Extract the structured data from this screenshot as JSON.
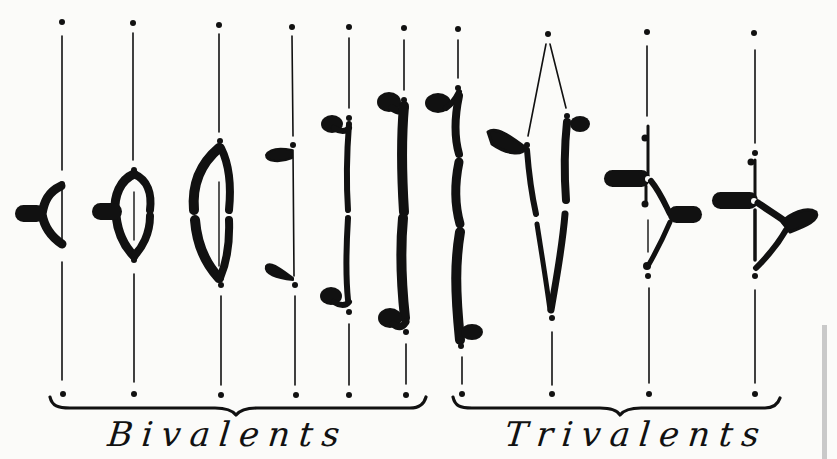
{
  "figure": {
    "type": "chromosome-configuration-diagram",
    "colors": {
      "ink": "#111111",
      "paper": "#fbfbf9",
      "strip": "#c9c9c9"
    },
    "groups": [
      {
        "label": "Bivalents",
        "configurations": [
          {
            "index": 1,
            "x": 62,
            "shape": "ring-small-with-side-arm"
          },
          {
            "index": 2,
            "x": 133,
            "shape": "ring-medium-with-side-arm"
          },
          {
            "index": 3,
            "x": 221,
            "shape": "ring-large-open"
          },
          {
            "index": 4,
            "x": 294,
            "shape": "two-separated-knobbed-chromatids"
          },
          {
            "index": 5,
            "x": 349,
            "shape": "rod-with-knobs-short"
          },
          {
            "index": 6,
            "x": 405,
            "shape": "rod-with-knobs-long"
          }
        ]
      },
      {
        "label": "Trivalents",
        "configurations": [
          {
            "index": 7,
            "x": 461,
            "shape": "chain-rod-with-terminal-knobs"
          },
          {
            "index": 8,
            "x": 549,
            "shape": "V-shaped-chain"
          },
          {
            "index": 9,
            "x": 649,
            "shape": "Y-shaped-branched"
          },
          {
            "index": 10,
            "x": 755,
            "shape": "Y-shaped-branched-ring"
          }
        ]
      }
    ],
    "pole_top_y": 22,
    "pole_bottom_y": 394
  },
  "labels": {
    "bivalents": "Bivalents",
    "trivalents": "Trivalents"
  }
}
